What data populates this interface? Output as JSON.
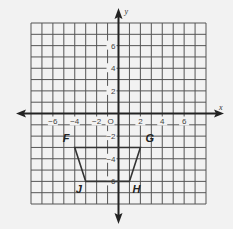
{
  "diagram": {
    "type": "coordinate-grid",
    "x_axis_label": "x",
    "y_axis_label": "y",
    "origin_label": "O",
    "x_range": [
      -8,
      8
    ],
    "y_range": [
      -8,
      8
    ],
    "x_tick_labels": [
      {
        "value": -6,
        "label": "−6"
      },
      {
        "value": -4,
        "label": "−4"
      },
      {
        "value": -2,
        "label": "−2"
      },
      {
        "value": 2,
        "label": "2"
      },
      {
        "value": 4,
        "label": "4"
      },
      {
        "value": 6,
        "label": "6"
      }
    ],
    "y_tick_labels": [
      {
        "value": 6,
        "label": "6"
      },
      {
        "value": 4,
        "label": "4"
      },
      {
        "value": 2,
        "label": "2"
      },
      {
        "value": -2,
        "label": "−2"
      },
      {
        "value": -4,
        "label": "−4"
      },
      {
        "value": -6,
        "label": "−6"
      }
    ],
    "shape": {
      "name": "trapezoid FGHJ",
      "vertices": [
        {
          "label": "F",
          "x": -4,
          "y": -3
        },
        {
          "label": "G",
          "x": 2,
          "y": -3
        },
        {
          "label": "H",
          "x": 1,
          "y": -6
        },
        {
          "label": "J",
          "x": -3,
          "y": -6
        }
      ]
    },
    "colors": {
      "background": "#f2f2f2",
      "grid": "#555555",
      "axis": "#222222",
      "shape": "#333333"
    }
  }
}
